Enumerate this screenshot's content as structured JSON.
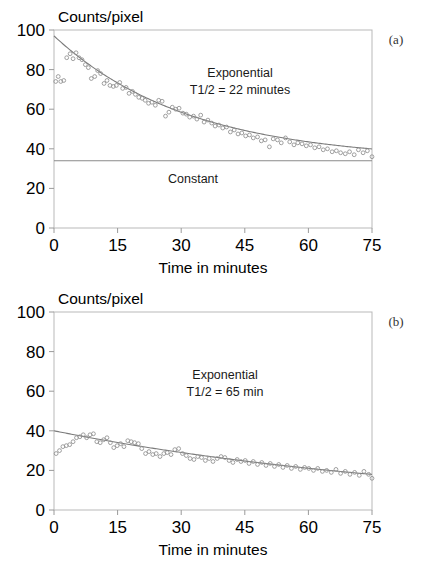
{
  "figure": {
    "background": "#ffffff",
    "axis_color": "#b9b9b9",
    "curve_color": "#7b7b7b",
    "marker_color": "#8f8f8f"
  },
  "panels": [
    {
      "tag": "(a)",
      "ylabel": "Counts/pixel",
      "xlabel": "Time in minutes",
      "annotation_line1": "Exponential",
      "annotation_line2": "T1/2 = 22 minutes",
      "constant_label": "Constant",
      "yticks": [
        "0",
        "20",
        "40",
        "60",
        "80",
        "100"
      ],
      "xticks": [
        "0",
        "15",
        "30",
        "45",
        "60",
        "75"
      ]
    },
    {
      "tag": "(b)",
      "ylabel": "Counts/pixel",
      "xlabel": "Time in minutes",
      "annotation_line1": "Exponential",
      "annotation_line2": "T1/2 = 65 min",
      "constant_label": "",
      "yticks": [
        "0",
        "20",
        "40",
        "60",
        "80",
        "100"
      ],
      "xticks": [
        "0",
        "15",
        "30",
        "45",
        "60",
        "75"
      ]
    }
  ],
  "chart_data": [
    {
      "type": "scatter",
      "title": "",
      "subtitle": "(a)",
      "xlabel": "Time in minutes",
      "ylabel": "Counts/pixel",
      "xlim": [
        0,
        75
      ],
      "ylim": [
        0,
        100
      ],
      "xticks": [
        0,
        15,
        30,
        45,
        60,
        75
      ],
      "yticks": [
        0,
        20,
        40,
        60,
        80,
        100
      ],
      "grid": false,
      "legend": "none",
      "annotations": [
        "Exponential",
        "T1/2 = 22 minutes",
        "Constant"
      ],
      "fit": {
        "name": "Exponential fit",
        "model": "y = A*exp(-ln2*t/T_half) + C",
        "amplitude": 63.0,
        "half_life_min": 22,
        "offset": 34.0,
        "y_at_0": 97.0,
        "y_at_75": 36.2
      },
      "constant_line": {
        "name": "Constant",
        "value": 34.0
      },
      "series": [
        {
          "name": "Counts/pixel vs time",
          "marker": "open-circle",
          "x": [
            0.4,
            1.0,
            1.6,
            2.3,
            3.0,
            3.8,
            4.5,
            5.2,
            5.9,
            6.6,
            7.4,
            8.1,
            8.8,
            9.6,
            10.3,
            11.0,
            11.8,
            12.5,
            13.2,
            14.0,
            14.7,
            15.5,
            16.2,
            17.0,
            17.7,
            18.5,
            19.2,
            20.0,
            20.8,
            21.5,
            22.3,
            23.1,
            23.9,
            24.7,
            25.5,
            26.3,
            27.1,
            27.9,
            28.7,
            29.5,
            30.4,
            31.2,
            32.0,
            32.9,
            33.7,
            34.6,
            35.4,
            36.3,
            37.2,
            38.0,
            38.9,
            39.8,
            40.7,
            41.6,
            42.5,
            43.4,
            44.3,
            45.2,
            46.1,
            47.0,
            48.0,
            48.9,
            49.8,
            50.8,
            51.7,
            52.7,
            53.6,
            54.6,
            55.6,
            56.6,
            57.5,
            58.5,
            59.5,
            60.5,
            61.5,
            62.5,
            63.5,
            64.5,
            65.6,
            66.6,
            67.6,
            68.7,
            69.7,
            70.8,
            71.8,
            72.9,
            73.9,
            75.0
          ],
          "y": [
            74.0,
            76.5,
            74.0,
            74.5,
            86.0,
            88.0,
            85.5,
            88.5,
            86.0,
            85.0,
            82.5,
            81.0,
            75.5,
            76.5,
            79.5,
            78.0,
            73.0,
            74.5,
            72.0,
            71.5,
            72.0,
            73.5,
            70.5,
            71.0,
            68.0,
            69.0,
            67.5,
            66.0,
            65.5,
            64.5,
            63.0,
            63.5,
            62.0,
            64.5,
            64.0,
            56.5,
            58.5,
            61.0,
            60.0,
            60.5,
            58.0,
            57.5,
            56.0,
            56.5,
            55.0,
            57.0,
            53.5,
            54.5,
            53.0,
            51.5,
            52.0,
            50.5,
            51.0,
            48.5,
            49.5,
            47.5,
            48.0,
            46.5,
            47.0,
            45.5,
            46.0,
            44.0,
            44.5,
            41.0,
            45.0,
            44.5,
            43.0,
            45.5,
            43.5,
            42.0,
            43.0,
            42.5,
            41.5,
            42.0,
            40.5,
            41.0,
            39.5,
            40.0,
            38.5,
            39.0,
            38.0,
            37.5,
            38.5,
            37.0,
            39.5,
            38.0,
            39.0,
            36.0
          ]
        }
      ]
    },
    {
      "type": "scatter",
      "title": "",
      "subtitle": "(b)",
      "xlabel": "Time in minutes",
      "ylabel": "Counts/pixel",
      "xlim": [
        0,
        75
      ],
      "ylim": [
        0,
        100
      ],
      "xticks": [
        0,
        15,
        30,
        45,
        60,
        75
      ],
      "yticks": [
        0,
        20,
        40,
        60,
        80,
        100
      ],
      "grid": false,
      "legend": "none",
      "annotations": [
        "Exponential",
        "T1/2 = 65 min"
      ],
      "fit": {
        "name": "Exponential fit",
        "model": "y = A*exp(-ln2*t/T_half)",
        "amplitude": 40.0,
        "half_life_min": 65,
        "offset": 0.0,
        "y_at_0": 40.0,
        "y_at_75": 18.1
      },
      "series": [
        {
          "name": "Counts/pixel vs time",
          "marker": "open-circle",
          "x": [
            0.5,
            1.3,
            2.1,
            2.9,
            3.7,
            4.5,
            5.3,
            6.1,
            6.9,
            7.7,
            8.5,
            9.3,
            10.1,
            10.9,
            11.7,
            12.5,
            13.3,
            14.1,
            14.9,
            15.7,
            16.5,
            17.4,
            18.2,
            19.0,
            19.9,
            20.7,
            21.6,
            22.4,
            23.3,
            24.1,
            25.0,
            25.9,
            26.7,
            27.6,
            28.5,
            29.4,
            30.3,
            31.2,
            32.1,
            33.0,
            33.9,
            34.8,
            35.7,
            36.6,
            37.5,
            38.5,
            39.4,
            40.3,
            41.3,
            42.2,
            43.2,
            44.1,
            45.1,
            46.0,
            47.0,
            48.0,
            49.0,
            50.0,
            51.0,
            52.0,
            53.0,
            54.0,
            55.0,
            56.0,
            57.0,
            58.1,
            59.1,
            60.1,
            61.2,
            62.2,
            63.3,
            64.3,
            65.4,
            66.5,
            67.6,
            68.7,
            69.8,
            70.9,
            72.0,
            73.1,
            74.2,
            75.0
          ],
          "y": [
            28.5,
            30.0,
            32.0,
            32.5,
            33.0,
            34.5,
            36.5,
            37.0,
            38.0,
            36.5,
            38.0,
            38.5,
            34.5,
            34.0,
            35.5,
            36.5,
            34.0,
            31.5,
            32.5,
            33.5,
            32.0,
            35.0,
            34.5,
            34.0,
            33.5,
            31.0,
            28.5,
            29.5,
            28.0,
            28.5,
            27.0,
            28.5,
            29.0,
            28.0,
            30.5,
            31.0,
            28.5,
            27.5,
            26.0,
            25.5,
            27.0,
            26.5,
            25.0,
            26.0,
            24.5,
            26.0,
            27.0,
            26.5,
            25.0,
            24.0,
            25.5,
            24.5,
            25.0,
            23.5,
            24.5,
            23.0,
            24.0,
            22.5,
            23.5,
            22.0,
            23.0,
            21.5,
            22.5,
            21.0,
            22.0,
            20.5,
            21.5,
            21.0,
            20.0,
            21.0,
            19.5,
            20.0,
            19.0,
            20.5,
            18.5,
            19.5,
            18.0,
            19.0,
            17.5,
            19.5,
            18.0,
            16.0
          ]
        }
      ]
    }
  ]
}
